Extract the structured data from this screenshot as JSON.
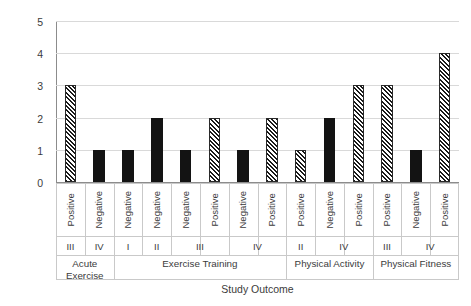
{
  "chart_data": {
    "type": "bar",
    "title": "",
    "xlabel": "Study Outcome",
    "ylabel": "Number of Studies",
    "ylim": [
      0,
      5
    ],
    "yticks": [
      0,
      1,
      2,
      3,
      4,
      5
    ],
    "grid": true,
    "legend_position": "none",
    "series_patterns": {
      "Positive": "diagonal-hatch",
      "Negative": "solid-black"
    },
    "categories": [
      "Positive",
      "Negative",
      "Negative",
      "Negative",
      "Negative",
      "Positive",
      "Negative",
      "Positive",
      "Positive",
      "Negative",
      "Positive",
      "Positive",
      "Negative",
      "Positive"
    ],
    "values": [
      3,
      1,
      1,
      2,
      1,
      2,
      1,
      2,
      1,
      2,
      3,
      3,
      1,
      4
    ],
    "bars": [
      {
        "outcome": "Positive",
        "roman": "III",
        "group": "Acute Exercise",
        "value": 3,
        "pattern": "hatched"
      },
      {
        "outcome": "Negative",
        "roman": "IV",
        "group": "Acute Exercise",
        "value": 1,
        "pattern": "solid"
      },
      {
        "outcome": "Negative",
        "roman": "I",
        "group": "Exercise Training",
        "value": 1,
        "pattern": "solid"
      },
      {
        "outcome": "Negative",
        "roman": "II",
        "group": "Exercise Training",
        "value": 2,
        "pattern": "solid"
      },
      {
        "outcome": "Negative",
        "roman": "III",
        "group": "Exercise Training",
        "value": 1,
        "pattern": "solid"
      },
      {
        "outcome": "Positive",
        "roman": "III",
        "group": "Exercise Training",
        "value": 2,
        "pattern": "hatched"
      },
      {
        "outcome": "Negative",
        "roman": "IV",
        "group": "Exercise Training",
        "value": 1,
        "pattern": "solid"
      },
      {
        "outcome": "Positive",
        "roman": "IV",
        "group": "Exercise Training",
        "value": 2,
        "pattern": "hatched"
      },
      {
        "outcome": "Positive",
        "roman": "II",
        "group": "Physical Activity",
        "value": 1,
        "pattern": "hatched"
      },
      {
        "outcome": "Negative",
        "roman": "IV",
        "group": "Physical Activity",
        "value": 2,
        "pattern": "solid"
      },
      {
        "outcome": "Positive",
        "roman": "IV",
        "group": "Physical Activity",
        "value": 3,
        "pattern": "hatched"
      },
      {
        "outcome": "Positive",
        "roman": "III",
        "group": "Physical Fitness",
        "value": 3,
        "pattern": "hatched"
      },
      {
        "outcome": "Negative",
        "roman": "IV",
        "group": "Physical Fitness",
        "value": 1,
        "pattern": "solid"
      },
      {
        "outcome": "Positive",
        "roman": "IV",
        "group": "Physical Fitness",
        "value": 4,
        "pattern": "hatched"
      }
    ],
    "roman_spans": [
      {
        "label": "III",
        "start": 0,
        "span": 1
      },
      {
        "label": "IV",
        "start": 1,
        "span": 1
      },
      {
        "label": "I",
        "start": 2,
        "span": 1
      },
      {
        "label": "II",
        "start": 3,
        "span": 1
      },
      {
        "label": "III",
        "start": 4,
        "span": 2
      },
      {
        "label": "IV",
        "start": 6,
        "span": 2
      },
      {
        "label": "II",
        "start": 8,
        "span": 1
      },
      {
        "label": "IV",
        "start": 9,
        "span": 2
      },
      {
        "label": "III",
        "start": 11,
        "span": 1
      },
      {
        "label": "IV",
        "start": 12,
        "span": 2
      }
    ],
    "group_spans": [
      {
        "label": "Acute Exercise",
        "start": 0,
        "span": 2
      },
      {
        "label": "Exercise Training",
        "start": 2,
        "span": 6
      },
      {
        "label": "Physical Activity",
        "start": 8,
        "span": 3
      },
      {
        "label": "Physical Fitness",
        "start": 11,
        "span": 3
      }
    ],
    "colors": {
      "bar_solid": "#131313",
      "bar_hatch": "#1a1a1a",
      "gridline": "#d9d9d9",
      "axis": "#8c8c8c",
      "text": "#3b3b3b",
      "background": "#ffffff"
    }
  }
}
